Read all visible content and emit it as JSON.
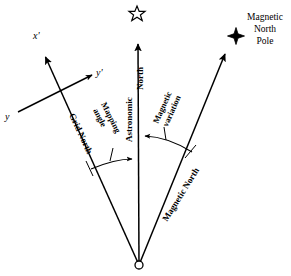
{
  "diagram": {
    "type": "vector-direction-diagram",
    "background_color": "#ffffff",
    "line_color": "#000000",
    "origin": {
      "label": "origin-point",
      "x": 139,
      "y": 265,
      "marker": "open-circle"
    },
    "rays": [
      {
        "name": "grid-north",
        "label": "Grid North",
        "from": {
          "x": 139,
          "y": 265
        },
        "to": {
          "x": 42,
          "y": 53
        },
        "arrowhead": "x-prime-arrow",
        "label_rotation_deg": 65
      },
      {
        "name": "astronomic-north",
        "label": "Astronomic North",
        "label_line_1": "Astronomic",
        "label_line_2": "North",
        "from": {
          "x": 139,
          "y": 265
        },
        "to": {
          "x": 138,
          "y": 40
        },
        "arrowhead": "up-arrow",
        "label_rotation_deg": -90,
        "terminal_symbol": "open-star"
      },
      {
        "name": "magnetic-north",
        "label": "Magnetic North",
        "from": {
          "x": 139,
          "y": 265
        },
        "to": {
          "x": 228,
          "y": 50
        },
        "arrowhead": "up-right-arrow",
        "label_rotation_deg": -58,
        "terminal_symbol": "filled-star"
      }
    ],
    "angles": [
      {
        "name": "mapping-angle",
        "label_line_1": "Mapping",
        "label_line_2": "angle",
        "between": [
          "grid-north",
          "astronomic-north"
        ],
        "arrow_direction": "toward-astronomic-north",
        "label_rotation_deg": 63
      },
      {
        "name": "magnetic-variation",
        "label_line_1": "Magnetic",
        "label_line_2": "variation",
        "between": [
          "astronomic-north",
          "magnetic-north"
        ],
        "arrow_direction": "toward-astronomic-north",
        "label_rotation_deg": -66
      }
    ],
    "grid_axes": {
      "name": "local-grid-axes",
      "x_axis_label": "x'",
      "y_axis_label": "y'",
      "y_origin_label": "y",
      "crossing_point": {
        "x": 58,
        "y": 91
      }
    },
    "annotations": {
      "magnetic_north_pole_line_1": "Magnetic",
      "magnetic_north_pole_line_2": "North",
      "magnetic_north_pole_line_3": "Pole",
      "astronomic_star_symbol": "open-five-pointed-star",
      "magnetic_star_symbol": "filled-four-pointed-star"
    }
  }
}
